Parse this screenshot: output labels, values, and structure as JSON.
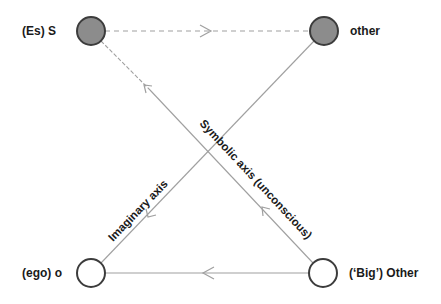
{
  "diagram": {
    "type": "Lacan Schema L",
    "nodes": [
      {
        "id": "S",
        "label": "(Es) S",
        "fill": "#8c8c8c",
        "stroke": "#3c3c3c"
      },
      {
        "id": "other",
        "label": "other",
        "fill": "#8c8c8c",
        "stroke": "#3c3c3c"
      },
      {
        "id": "ego",
        "label": "(ego) o",
        "fill": "#ffffff",
        "stroke": "#3c3c3c"
      },
      {
        "id": "Other",
        "label": "(‘Big’) Other",
        "fill": "#ffffff",
        "stroke": "#3c3c3c"
      }
    ],
    "edges": [
      {
        "from": "S",
        "to": "other",
        "style": "dashed",
        "arrow": "toward other"
      },
      {
        "from": "Other",
        "to": "ego",
        "style": "solid",
        "arrow": "toward ego"
      },
      {
        "from": "Other",
        "to": "S",
        "style": "solid/dashed near S",
        "arrow": "toward S",
        "label": "Symbolic axis (unconscious)"
      },
      {
        "from": "other",
        "to": "ego",
        "style": "solid",
        "arrow": "toward ego",
        "label": "Imaginary axis"
      }
    ],
    "axis_labels": {
      "symbolic": "Symbolic axis (unconscious)",
      "imaginary": "Imaginary axis"
    },
    "colors": {
      "line": "#a0a0a0",
      "filled_node": "#8c8c8c",
      "node_stroke": "#3c3c3c",
      "text": "#1a1a1a"
    }
  }
}
